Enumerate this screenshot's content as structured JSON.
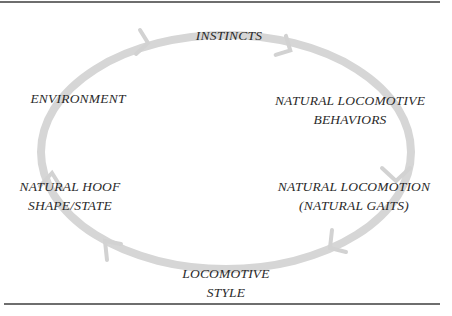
{
  "diagram": {
    "type": "cycle",
    "direction": "clockwise",
    "ring_color": "#d4d4d4",
    "text_color": "#2a2a2a",
    "rule_color": "#6e6e6e",
    "nodes": [
      {
        "id": "instincts",
        "lines": [
          "INSTINCTS"
        ]
      },
      {
        "id": "natural-locomotive-behaviors",
        "lines": [
          "NATURAL LOCOMOTIVE",
          "BEHAVIORS"
        ]
      },
      {
        "id": "natural-locomotion",
        "lines": [
          "NATURAL LOCOMOTION",
          "(NATURAL GAITS)"
        ]
      },
      {
        "id": "locomotive-style",
        "lines": [
          "LOCOMOTIVE",
          "STYLE"
        ]
      },
      {
        "id": "natural-hoof-shape",
        "lines": [
          "NATURAL HOOF",
          "SHAPE/STATE"
        ]
      },
      {
        "id": "environment",
        "lines": [
          "ENVIRONMENT"
        ]
      }
    ],
    "arrows": [
      {
        "from": "environment",
        "to": "instincts"
      },
      {
        "from": "instincts",
        "to": "natural-locomotive-behaviors"
      },
      {
        "from": "natural-locomotive-behaviors",
        "to": "natural-locomotion"
      },
      {
        "from": "natural-locomotion",
        "to": "locomotive-style"
      },
      {
        "from": "locomotive-style",
        "to": "natural-hoof-shape"
      },
      {
        "from": "natural-hoof-shape",
        "to": "environment"
      }
    ]
  }
}
